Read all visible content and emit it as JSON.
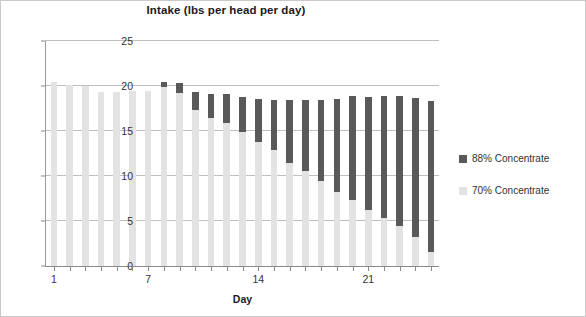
{
  "chart_data": {
    "type": "bar",
    "stacked": true,
    "title": "Intake (lbs per head per day)",
    "xlabel": "Day",
    "ylabel": "",
    "ylim": [
      0,
      25
    ],
    "yticks": [
      0,
      5,
      10,
      15,
      20,
      25
    ],
    "xlim": [
      0.5,
      25.5
    ],
    "xticks_labeled": [
      1,
      7,
      14,
      21
    ],
    "grid": true,
    "legend_position": "right",
    "categories": [
      1,
      2,
      3,
      4,
      5,
      6,
      7,
      8,
      9,
      10,
      11,
      12,
      13,
      14,
      15,
      16,
      17,
      18,
      19,
      20,
      21,
      22,
      23,
      24,
      25
    ],
    "series": [
      {
        "name": "70% Concentrate",
        "color": "#e3e3e3",
        "values": [
          20.5,
          20.1,
          20.0,
          19.3,
          19.3,
          19.4,
          19.4,
          19.9,
          19.2,
          17.3,
          16.5,
          15.9,
          14.9,
          13.8,
          12.9,
          11.4,
          10.6,
          9.4,
          8.2,
          7.3,
          6.2,
          5.3,
          4.5,
          3.2,
          1.6
        ]
      },
      {
        "name": "88% Concentrate",
        "color": "#595959",
        "values": [
          0.0,
          0.0,
          0.0,
          0.0,
          0.0,
          0.0,
          0.0,
          0.5,
          1.1,
          2.0,
          2.6,
          3.2,
          3.9,
          4.8,
          5.5,
          7.0,
          7.9,
          9.1,
          10.4,
          11.6,
          12.6,
          13.6,
          14.4,
          15.5,
          16.7
        ]
      }
    ],
    "totals": [
      20.5,
      20.1,
      20.0,
      19.3,
      19.3,
      19.4,
      19.4,
      20.4,
      20.3,
      19.3,
      19.1,
      19.1,
      18.8,
      18.6,
      18.4,
      18.4,
      18.5,
      18.5,
      18.6,
      18.9,
      18.8,
      18.9,
      18.9,
      18.7,
      18.3
    ]
  },
  "legend": {
    "items": [
      {
        "label": "88% Concentrate",
        "color": "#595959"
      },
      {
        "label": "70% Concentrate",
        "color": "#e3e3e3"
      }
    ]
  }
}
